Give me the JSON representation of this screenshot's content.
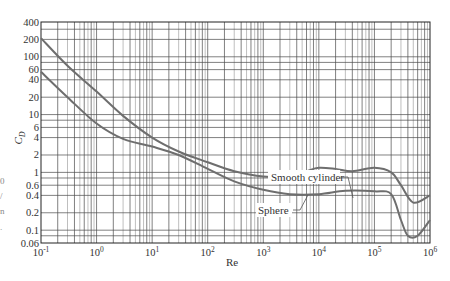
{
  "chart_data": {
    "type": "line",
    "title": "",
    "xlabel": "Re",
    "ylabel": "C_D",
    "xscale": "log",
    "yscale": "log",
    "xlim": [
      0.1,
      1000000
    ],
    "ylim": [
      0.06,
      400
    ],
    "grid": true,
    "x_ticks": [
      {
        "value": 0.1,
        "label": "10",
        "exp": "-1"
      },
      {
        "value": 1,
        "label": "10",
        "exp": "0"
      },
      {
        "value": 10,
        "label": "10",
        "exp": "1"
      },
      {
        "value": 100,
        "label": "10",
        "exp": "2"
      },
      {
        "value": 1000,
        "label": "10",
        "exp": "3"
      },
      {
        "value": 10000,
        "label": "10",
        "exp": "4"
      },
      {
        "value": 100000,
        "label": "10",
        "exp": "5"
      },
      {
        "value": 1000000,
        "label": "10",
        "exp": "6"
      }
    ],
    "y_ticks": [
      {
        "value": 400,
        "label": "400"
      },
      {
        "value": 200,
        "label": "200"
      },
      {
        "value": 100,
        "label": "100"
      },
      {
        "value": 60,
        "label": "60"
      },
      {
        "value": 40,
        "label": "40"
      },
      {
        "value": 20,
        "label": "20"
      },
      {
        "value": 10,
        "label": "10"
      },
      {
        "value": 6,
        "label": "6"
      },
      {
        "value": 4,
        "label": "4"
      },
      {
        "value": 2,
        "label": "2"
      },
      {
        "value": 1,
        "label": "1"
      },
      {
        "value": 0.6,
        "label": "0.6"
      },
      {
        "value": 0.4,
        "label": "0.4"
      },
      {
        "value": 0.2,
        "label": "0.2"
      },
      {
        "value": 0.1,
        "label": "0.1"
      },
      {
        "value": 0.06,
        "label": "0.06"
      }
    ],
    "series": [
      {
        "name": "Smooth cylinder",
        "x": [
          0.1,
          0.3,
          1,
          3,
          10,
          30,
          100,
          300,
          1000,
          3000,
          6000,
          10000,
          20000,
          40000,
          100000,
          200000,
          300000,
          500000,
          1000000
        ],
        "y": [
          210,
          70,
          25,
          9.5,
          4.0,
          2.3,
          1.5,
          1.05,
          0.85,
          0.85,
          1.05,
          1.2,
          1.15,
          1.05,
          1.2,
          1.0,
          0.6,
          0.3,
          0.4
        ]
      },
      {
        "name": "Sphere",
        "x": [
          0.1,
          0.3,
          1,
          3,
          10,
          30,
          100,
          300,
          1000,
          3000,
          10000,
          30000,
          100000,
          200000,
          300000,
          400000,
          600000,
          1000000
        ],
        "y": [
          55,
          20,
          7.0,
          3.8,
          2.8,
          2.0,
          1.15,
          0.7,
          0.5,
          0.42,
          0.42,
          0.48,
          0.47,
          0.42,
          0.15,
          0.08,
          0.08,
          0.15
        ]
      }
    ],
    "annotations": [
      {
        "text": "Smooth cylinder",
        "x": 40000,
        "y": 2.0,
        "points_to": "Smooth cylinder"
      },
      {
        "text": "Sphere",
        "x": 800,
        "y": 0.25,
        "points_to": "Sphere"
      }
    ],
    "legend": "none (inline labels)"
  },
  "labels": {
    "ylabel_main": "C",
    "ylabel_sub": "D",
    "xlabel": "Re",
    "cylinder": "Smooth cylinder",
    "sphere": "Sphere"
  },
  "margin_fragments": [
    "0",
    "/",
    "n",
    "."
  ]
}
